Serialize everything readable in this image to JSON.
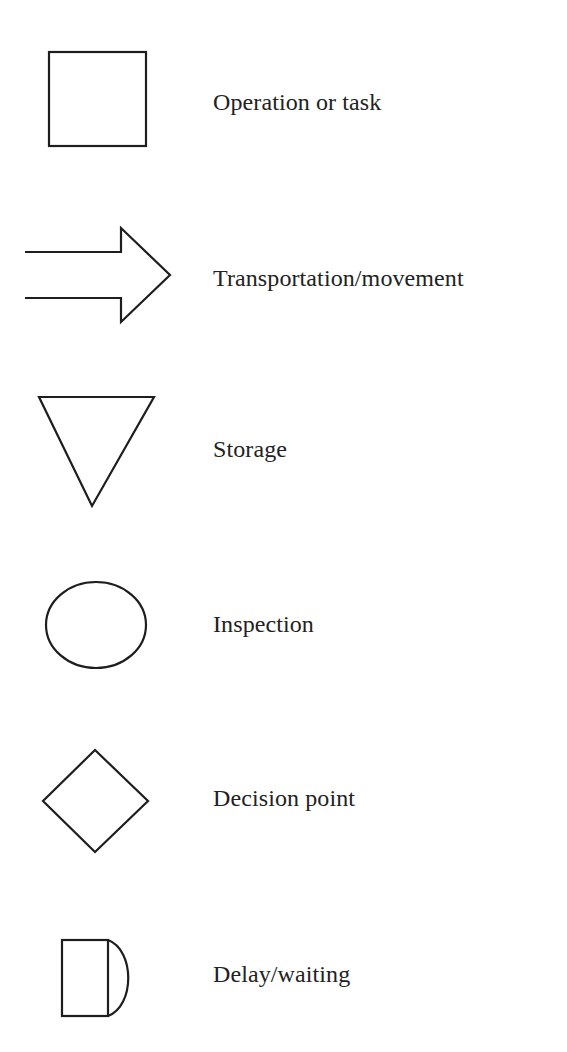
{
  "legend": {
    "items": [
      {
        "symbol": "operation-square",
        "label": "Operation or task"
      },
      {
        "symbol": "transportation-arrow",
        "label": "Transportation/movement"
      },
      {
        "symbol": "storage-triangle",
        "label": "Storage"
      },
      {
        "symbol": "inspection-circle",
        "label": "Inspection"
      },
      {
        "symbol": "decision-diamond",
        "label": "Decision point"
      },
      {
        "symbol": "delay-d-shape",
        "label": "Delay/waiting"
      }
    ]
  },
  "colors": {
    "stroke": "#1e1e1e",
    "text": "#222222",
    "background": "#ffffff"
  }
}
